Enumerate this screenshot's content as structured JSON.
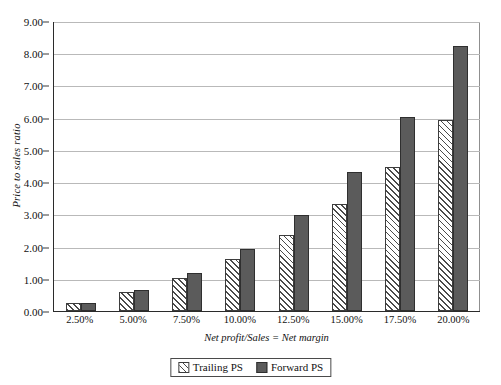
{
  "chart_data": {
    "type": "bar",
    "title": "",
    "xlabel": "Net profit/Sales = Net margin",
    "ylabel": "Price to sales ratio",
    "categories": [
      "2.50%",
      "5.00%",
      "7.50%",
      "10.00%",
      "12.50%",
      "15.00%",
      "17.50%",
      "20.00%"
    ],
    "series": [
      {
        "name": "Trailing PS",
        "values": [
          0.25,
          0.58,
          1.01,
          1.61,
          2.36,
          3.32,
          4.46,
          5.93
        ]
      },
      {
        "name": "Forward PS",
        "values": [
          0.25,
          0.64,
          1.18,
          1.92,
          2.98,
          4.31,
          6.02,
          8.22
        ]
      }
    ],
    "ylim": [
      0,
      9
    ],
    "ytick_labels": [
      "9.00",
      "8.00",
      "7.00",
      "6.00",
      "5.00",
      "4.00",
      "3.00",
      "2.00",
      "1.00",
      "0.00"
    ],
    "ytick_values": [
      9,
      8,
      7,
      6,
      5,
      4,
      3,
      2,
      1,
      0
    ],
    "grid": true,
    "legend_position": "bottom",
    "colors": {
      "trailing_fill": "#ffffff",
      "trailing_hatch": "#4a4a4a",
      "forward_fill": "#5b5b5b",
      "axis": "#2b2b2b",
      "gridline": "#b9b9b9",
      "background": "#ffffff"
    }
  }
}
